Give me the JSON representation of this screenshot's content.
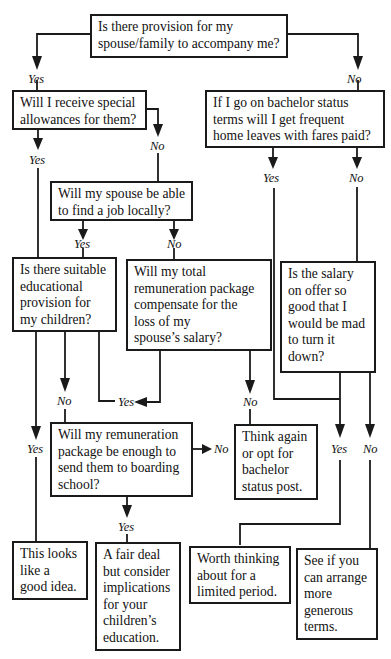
{
  "nodes": {
    "q_provision": {
      "lines": [
        "Is there provision for my",
        "spouse/family to accompany me?"
      ]
    },
    "q_allowances": {
      "lines": [
        "Will I receive special",
        "allowances for them?"
      ]
    },
    "q_bachelor": {
      "lines": [
        "If I go on bachelor status",
        "terms will I get frequent",
        "home leaves with fares paid?"
      ]
    },
    "q_spouse_job": {
      "lines": [
        "Will my spouse be able",
        "to find a job locally?"
      ]
    },
    "q_education": {
      "lines": [
        "Is there suitable",
        "educational",
        "provision for",
        "my children?"
      ]
    },
    "q_compensate": {
      "lines": [
        "Will my total",
        "remuneration package",
        "compensate for the",
        "loss of my",
        "spouse’s salary?"
      ]
    },
    "q_salary": {
      "lines": [
        "Is the salary",
        "on offer so",
        "good that I",
        "would be mad",
        "to turn it",
        "down?"
      ]
    },
    "q_boarding": {
      "lines": [
        "Will my remuneration",
        "package be enough to",
        "send them to boarding",
        "school?"
      ]
    },
    "o_think_again": {
      "lines": [
        "Think again",
        "or opt for",
        "bachelor",
        "status post."
      ]
    },
    "o_good_idea": {
      "lines": [
        "This looks",
        "like a",
        "good idea."
      ]
    },
    "o_fair_deal": {
      "lines": [
        "A fair deal",
        "but consider",
        "implications",
        "for your",
        "children’s",
        "education."
      ]
    },
    "o_worth_thinking": {
      "lines": [
        "Worth thinking",
        "about for a",
        "limited period."
      ]
    },
    "o_generous_terms": {
      "lines": [
        "See if you",
        "can arrange",
        "more",
        "generous",
        "terms."
      ]
    }
  },
  "labels": {
    "provision_yes": "Yes",
    "provision_no": "No",
    "allowances_yes": "Yes",
    "allowances_no": "No",
    "bachelor_yes": "Yes",
    "bachelor_no": "No",
    "spouse_job_yes": "Yes",
    "spouse_job_no": "No",
    "education_no": "No",
    "education_yes": "Yes",
    "compensate_yes": "Yes",
    "compensate_no": "No",
    "boarding_no": "No",
    "boarding_yes": "Yes",
    "salary_yes": "Yes",
    "salary_no": "No"
  }
}
